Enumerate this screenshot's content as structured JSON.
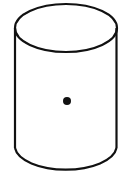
{
  "diagram": {
    "type": "cylinder",
    "background": "#ffffff",
    "stroke_color": "#111111",
    "stroke_width": 2.2,
    "cylinder": {
      "center_x": 66,
      "left_x": 15,
      "right_x": 116.5,
      "top_ellipse": {
        "cx": 66,
        "cy": 28,
        "rx": 51,
        "ry": 24
      },
      "body_bottom_y": 148,
      "bottom_arc": {
        "cx": 66,
        "cy": 148,
        "rx": 51,
        "ry": 24
      }
    },
    "center_point": {
      "cx": 67,
      "cy": 101,
      "r": 4,
      "fill": "#111111"
    }
  }
}
